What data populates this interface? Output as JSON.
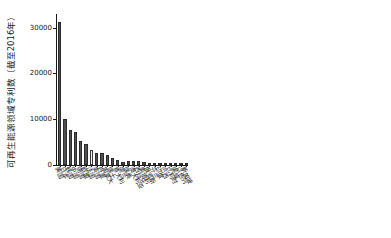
{
  "chart_data": {
    "type": "bar",
    "title": "",
    "subtitle": "",
    "xlabel": "",
    "ylabel": "可再生能源领域专利数（截至2016年）",
    "ylim": [
      0,
      33000
    ],
    "yticks": [
      0,
      10000,
      20000,
      30000
    ],
    "ytick_labels": [
      "0",
      "10000",
      "20000",
      "30000"
    ],
    "grid": false,
    "legend": false,
    "bar_color": "#4f4f4f",
    "highlight_color": "#f2f2f2",
    "highlight_index": 6,
    "categories": [
      "美国",
      "日本",
      "韩国",
      "中国",
      "德国",
      "欧盟",
      "法国",
      "英国",
      "丹麦",
      "加拿大",
      "瑞士",
      "意大利",
      "荷兰",
      "瑞典",
      "澳大利亚",
      "西班牙",
      "奥地利",
      "俄罗斯",
      "芬兰",
      "印度",
      "巴西",
      "比利时",
      "挪威",
      "以色列",
      "新加坡"
    ],
    "values": [
      31200,
      10100,
      7600,
      7300,
      5200,
      4700,
      3200,
      2700,
      2600,
      2200,
      1600,
      1000,
      700,
      900,
      850,
      800,
      600,
      500,
      420,
      360,
      300,
      260,
      220,
      180,
      150
    ]
  }
}
